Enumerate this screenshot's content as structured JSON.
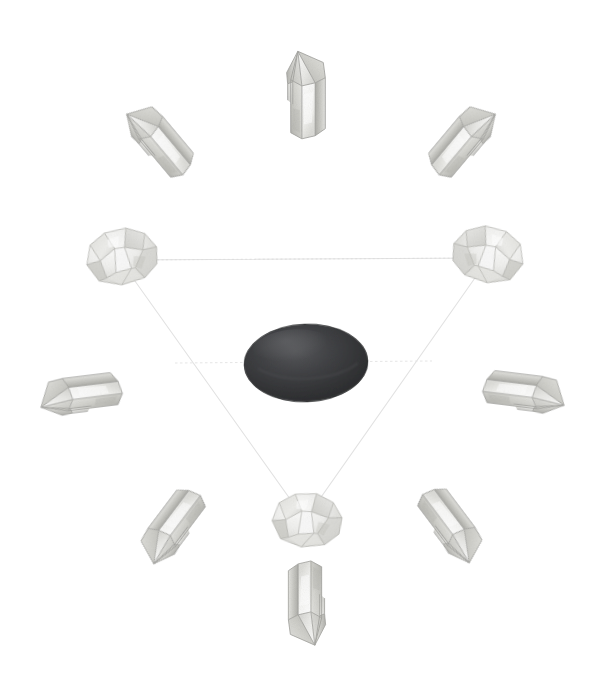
{
  "page": {
    "title": "Crystal Grid Layout",
    "background_color": "#ffffff",
    "width": 611,
    "height": 698
  },
  "grid": {
    "name": "triangle-crystal-grid",
    "shape": "triangle",
    "line_color": "#e2e2e2",
    "line_style": "dotted-thin",
    "line_width": 1,
    "center_guide_line": true,
    "triangle_vertices": [
      {
        "id": "vertex-top-left",
        "x": 120,
        "y": 260
      },
      {
        "id": "vertex-top-right",
        "x": 489,
        "y": 258
      },
      {
        "id": "vertex-bottom",
        "x": 305,
        "y": 520
      }
    ],
    "center_guide": {
      "x1": 175,
      "y1": 363,
      "x2": 432,
      "y2": 361
    }
  },
  "center_stone": {
    "label": "center-stone",
    "type": "tumbled-oval-stone",
    "color_dark": "#2f2f31",
    "color_mid": "#3f4042",
    "color_light": "#555659",
    "cx": 306,
    "cy": 363,
    "rx": 62,
    "ry": 39,
    "rotation": -2
  },
  "stone_palette": {
    "quartz_light": "#f5f5f3",
    "quartz_mid": "#dcdcd8",
    "quartz_shadow": "#b8b8b4",
    "quartz_deep": "#9a9a96",
    "quartz_edge": "#c9c9c5",
    "outline": "#a9a9a5"
  },
  "stones": [
    {
      "id": "crystal-point-north",
      "label": "Clear quartz point — north",
      "type": "quartz-point",
      "ring": "outer",
      "position": "top",
      "direction": "pointing-up",
      "x": 307,
      "y": 92,
      "size": 96,
      "rotation": 0
    },
    {
      "id": "crystal-point-northwest",
      "label": "Clear quartz point — northwest",
      "type": "quartz-point",
      "ring": "outer",
      "position": "top-left",
      "direction": "pointing-up-left",
      "x": 158,
      "y": 138,
      "size": 96,
      "rotation": -40
    },
    {
      "id": "crystal-point-northeast",
      "label": "Clear quartz point — northeast",
      "type": "quartz-point",
      "ring": "outer",
      "position": "top-right",
      "direction": "pointing-up-right",
      "x": 464,
      "y": 138,
      "size": 96,
      "rotation": 40
    },
    {
      "id": "crystal-point-west",
      "label": "Clear quartz point — west",
      "type": "quartz-point",
      "ring": "outer",
      "position": "left",
      "direction": "pointing-left",
      "x": 78,
      "y": 394,
      "size": 96,
      "rotation": -97
    },
    {
      "id": "crystal-point-east",
      "label": "Clear quartz point — east",
      "type": "quartz-point",
      "ring": "outer",
      "position": "right",
      "direction": "pointing-right",
      "x": 527,
      "y": 392,
      "size": 96,
      "rotation": 97
    },
    {
      "id": "crystal-point-southwest",
      "label": "Clear quartz point — southwest",
      "type": "quartz-point",
      "ring": "outer",
      "position": "bottom-left",
      "direction": "pointing-down-left",
      "x": 170,
      "y": 528,
      "size": 96,
      "rotation": -143
    },
    {
      "id": "crystal-point-southeast",
      "label": "Clear quartz point — southeast",
      "type": "quartz-point",
      "ring": "outer",
      "position": "bottom-right",
      "direction": "pointing-down-right",
      "x": 453,
      "y": 527,
      "size": 96,
      "rotation": 143
    },
    {
      "id": "crystal-point-south",
      "label": "Clear quartz point — south",
      "type": "quartz-point",
      "ring": "outer",
      "position": "bottom",
      "direction": "pointing-down",
      "x": 306,
      "y": 606,
      "size": 96,
      "rotation": 180
    },
    {
      "id": "tumbled-stone-top-left",
      "label": "Rough quartz chunk — triangle vertex top-left",
      "type": "rough-chunk",
      "ring": "triangle-vertex",
      "position": "vertex-top-left",
      "x": 120,
      "y": 258,
      "size": 92,
      "rotation": -8
    },
    {
      "id": "tumbled-stone-top-right",
      "label": "Rough quartz chunk — triangle vertex top-right",
      "type": "rough-chunk",
      "ring": "triangle-vertex",
      "position": "vertex-top-right",
      "x": 490,
      "y": 256,
      "size": 92,
      "rotation": 10
    },
    {
      "id": "tumbled-stone-bottom",
      "label": "Rough quartz chunk — triangle vertex bottom",
      "type": "rough-chunk",
      "ring": "triangle-vertex",
      "position": "vertex-bottom",
      "x": 305,
      "y": 521,
      "size": 92,
      "rotation": 4
    }
  ],
  "counts": {
    "outer_points": 8,
    "vertex_stones": 3,
    "center_stones": 1,
    "total_stones": 12
  }
}
